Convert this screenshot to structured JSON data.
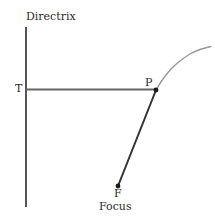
{
  "figure": {
    "kind": "parabola-focus-directrix-diagram",
    "width": 215,
    "height": 220,
    "background": "#ffffff"
  },
  "labels": {
    "directrix": "Directrix",
    "tangent_point": "T",
    "point_p": "P",
    "focus_short": "F",
    "focus_long": "Focus"
  },
  "colors": {
    "directrix_line": "#555555",
    "horizontal_segment": "#666666",
    "focal_segment": "#333333",
    "parabola_curve": "#999999",
    "point_marker": "#1a1a1a",
    "text": "#2b2b2b"
  },
  "chart_data": {
    "type": "line",
    "xlabel": "",
    "ylabel": "",
    "xlim": [
      0,
      215
    ],
    "ylim": [
      220,
      0
    ],
    "grid": false,
    "legend": null,
    "annotations": [
      {
        "text": "Directrix",
        "x": 26,
        "y": 20,
        "anchor": "start"
      },
      {
        "text": "T",
        "x": 20,
        "y": 92,
        "anchor": "middle"
      },
      {
        "text": "P",
        "x": 150,
        "y": 86,
        "anchor": "middle"
      },
      {
        "text": "F",
        "x": 118,
        "y": 197,
        "anchor": "middle"
      },
      {
        "text": "Focus",
        "x": 118,
        "y": 210,
        "anchor": "middle"
      }
    ],
    "series": [
      {
        "name": "directrix",
        "role": "directrix-line",
        "color": "#555555",
        "width": 2,
        "x": [
          26,
          26
        ],
        "y": [
          27,
          207
        ]
      },
      {
        "name": "segment-TP",
        "role": "perpendicular-distance-to-directrix",
        "color": "#666666",
        "width": 2,
        "x": [
          26,
          156
        ],
        "y": [
          89.5,
          89.5
        ]
      },
      {
        "name": "segment-PF",
        "role": "distance-to-focus",
        "color": "#333333",
        "width": 2,
        "x": [
          156,
          118
        ],
        "y": [
          90,
          186
        ]
      },
      {
        "name": "parabola",
        "role": "conic-curve",
        "color": "#999999",
        "width": 1.4,
        "x": [
          156,
          163,
          171,
          180,
          190,
          200,
          211
        ],
        "y": [
          90,
          79,
          69,
          61,
          54,
          49.5,
          46.5
        ]
      }
    ],
    "points": [
      {
        "name": "P",
        "x": 156,
        "y": 90,
        "radius": 2.4,
        "color": "#1a1a1a"
      },
      {
        "name": "F",
        "x": 118,
        "y": 186,
        "radius": 2.4,
        "color": "#1a1a1a"
      }
    ]
  }
}
